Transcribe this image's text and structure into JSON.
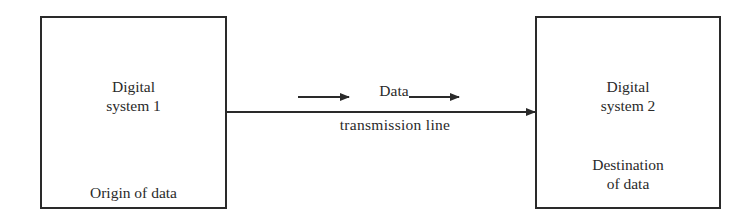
{
  "diagram": {
    "source": {
      "title": "Digital\nsystem 1",
      "role": "Origin of data"
    },
    "destination": {
      "title": "Digital\nsystem 2",
      "role": "Destination\nof data"
    },
    "link": {
      "flow_label": "Data",
      "line_label": "transmission line"
    },
    "colors": {
      "ink": "#2a2a2a",
      "background": "#ffffff"
    }
  }
}
